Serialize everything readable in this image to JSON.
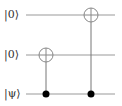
{
  "circuit": {
    "qubits": [
      {
        "label": "|0⟩",
        "y": 15
      },
      {
        "label": "|0⟩",
        "y": 55
      },
      {
        "label": "|ψ⟩",
        "y": 94
      }
    ],
    "wire_x_start": 26,
    "wire_x_end": 115,
    "gates": [
      {
        "type": "CNOT",
        "control_qubit": 2,
        "target_qubit": 1,
        "x": 46
      },
      {
        "type": "CNOT",
        "control_qubit": 2,
        "target_qubit": 0,
        "x": 91
      }
    ],
    "colors": {
      "wire": "#999999",
      "gate": "#888888",
      "control": "#000000",
      "text": "#333333"
    }
  }
}
